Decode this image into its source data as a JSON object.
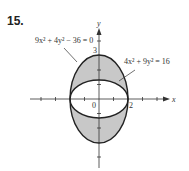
{
  "problem": {
    "number": "15."
  },
  "figure": {
    "outer_equation": "9x² + 4y² − 36 = 0",
    "inner_equation": "4x² + 9y² = 16",
    "axis_x_label": "x",
    "axis_y_label": "y",
    "origin_label": "0",
    "x_intercept_label": "2",
    "y_intercept_label": "3",
    "shaded_color": "#c8c8c8",
    "curve_color": "#222222"
  }
}
